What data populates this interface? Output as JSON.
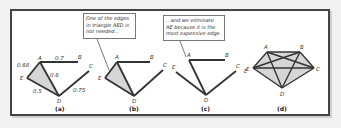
{
  "figure": {
    "panels": [
      {
        "caption": "(a)",
        "nodes": {
          "A": "A",
          "B": "B",
          "C": "C",
          "D": "D",
          "E": "E"
        },
        "edges": [
          {
            "from": "E",
            "to": "A",
            "weight": "0.68"
          },
          {
            "from": "A",
            "to": "B",
            "weight": "0.7"
          },
          {
            "from": "A",
            "to": "D",
            "weight": "0.6"
          },
          {
            "from": "E",
            "to": "D",
            "weight": "0.5"
          },
          {
            "from": "D",
            "to": "C",
            "weight": "0.75"
          }
        ],
        "shaded_triangle": "AED"
      },
      {
        "caption": "(b)",
        "nodes": {
          "A": "A",
          "B": "B",
          "C": "C",
          "D": "D",
          "E": "E"
        },
        "callout": "One of the edges in triangle AED is not needed...",
        "shaded_triangle": "AED"
      },
      {
        "caption": "(c)",
        "nodes": {
          "A": "A",
          "B": "B",
          "C": "C",
          "D": "D",
          "E": "E",
          "E2": "E"
        },
        "callout": "...and we eliminate AE because it is the most expensive edge."
      },
      {
        "caption": "(d)",
        "nodes": {
          "A": "A",
          "B": "B",
          "C": "C",
          "D": "D",
          "E": "E"
        }
      }
    ]
  },
  "colors": {
    "edge": "#333333",
    "shade": "#d4d4d4",
    "frame": "#444444",
    "background": "#f2f2f2"
  }
}
